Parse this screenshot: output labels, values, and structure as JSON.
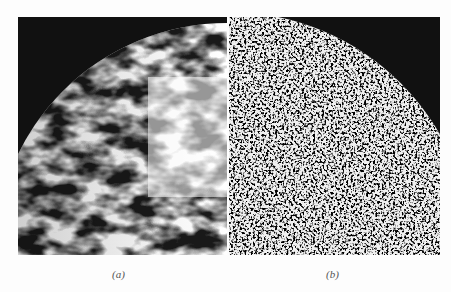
{
  "figure": {
    "panels": [
      {
        "label": "(a)",
        "description": "micrograph with coarse dark and light domains, black top-left corner outside circular boundary"
      },
      {
        "label": "(b)",
        "description": "micrograph with fine speckle texture, black top-right corner outside circular boundary"
      }
    ]
  },
  "colors": {
    "background": "#fdfdfd",
    "dark": "#111111",
    "light": "#f2f2f2"
  }
}
